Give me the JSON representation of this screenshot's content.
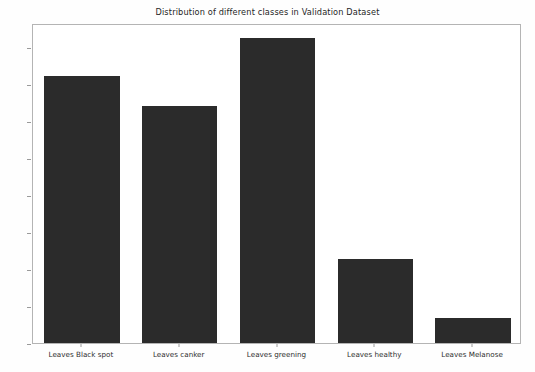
{
  "chart_data": {
    "type": "bar",
    "title": "Distribution of different classes in Validation Dataset",
    "xlabel": "",
    "ylabel": "",
    "categories": [
      "Leaves Black spot",
      "Leaves canker",
      "Leaves greening",
      "Leaves healthy",
      "Leaves Melanose"
    ],
    "values": [
      18.0,
      16.0,
      20.6,
      5.7,
      1.7
    ],
    "ylim": [
      0.0,
      21.6
    ],
    "yticks": [
      0.0,
      2.5,
      5.0,
      7.5,
      10.0,
      12.5,
      15.0,
      17.5,
      20.0
    ],
    "ytick_labels": [
      "0.0",
      "2.5",
      "5.0",
      "7.5",
      "10.0",
      "12.5",
      "15.0",
      "17.5",
      "20.0"
    ],
    "grid": false,
    "legend": false,
    "bar_color": "#2b2b2b",
    "axes_color": "#b4b4b4",
    "background_color": "#ffffff"
  }
}
